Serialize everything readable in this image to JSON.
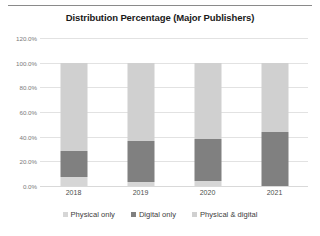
{
  "chart_data": {
    "type": "bar",
    "subtype": "stacked-column-100",
    "title": "Distribution Percentage (Major Publishers)",
    "xlabel": "",
    "ylabel": "",
    "categories": [
      "2018",
      "2019",
      "2020",
      "2021"
    ],
    "series": [
      {
        "name": "Physical only",
        "values": [
          7.0,
          3.0,
          4.0,
          0.0
        ],
        "color": "#d6d6d6"
      },
      {
        "name": "Digital only",
        "values": [
          21.0,
          33.5,
          34.0,
          43.5
        ],
        "color": "#808080"
      },
      {
        "name": "Physical & digital",
        "values": [
          72.0,
          63.5,
          62.0,
          56.5
        ],
        "color": "#d0d0d0"
      }
    ],
    "ylim": [
      0,
      120
    ],
    "ytick_values": [
      0,
      20,
      40,
      60,
      80,
      100,
      120
    ],
    "ytick_labels": [
      "0.0%",
      "20.0%",
      "40.0%",
      "60.0%",
      "80.0%",
      "100.0%",
      "120.0%"
    ],
    "grid": true,
    "legend_position": "bottom"
  },
  "legend": {
    "items": [
      {
        "label": "Physical only",
        "color": "#d6d6d6"
      },
      {
        "label": "Digital only",
        "color": "#808080"
      },
      {
        "label": "Physical & digital",
        "color": "#d0d0d0"
      }
    ]
  },
  "colors": {
    "gridline": "#e2e2e2",
    "axis": "#d9d9d9",
    "tick_text": "#7a7a7a",
    "category_text": "#4d4d4d",
    "title_text": "#1a1a1a",
    "rule": "#8a8a8a",
    "background": "#ffffff"
  }
}
